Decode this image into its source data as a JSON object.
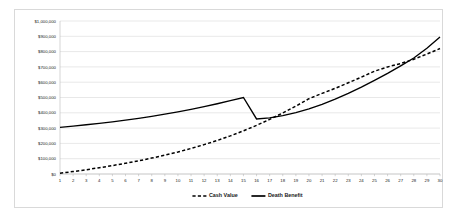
{
  "chart_data": {
    "type": "line",
    "title": "",
    "subtitle": "",
    "xlabel": "",
    "ylabel": "",
    "xlim": [
      1,
      30
    ],
    "ylim": [
      0,
      1000000
    ],
    "grid": true,
    "legend_position": "bottom",
    "x": [
      1,
      2,
      3,
      4,
      5,
      6,
      7,
      8,
      9,
      10,
      11,
      12,
      13,
      14,
      15,
      16,
      17,
      18,
      19,
      20,
      21,
      22,
      23,
      24,
      25,
      26,
      27,
      28,
      29,
      30
    ],
    "x_tick_labels": [
      "1",
      "2",
      "3",
      "4",
      "5",
      "6",
      "7",
      "8",
      "9",
      "10",
      "11",
      "12",
      "13",
      "14",
      "15",
      "16",
      "17",
      "18",
      "19",
      "20",
      "21",
      "22",
      "23",
      "24",
      "25",
      "26",
      "27",
      "28",
      "29",
      "30"
    ],
    "y_tick_values": [
      0,
      100000,
      200000,
      300000,
      400000,
      500000,
      600000,
      700000,
      800000,
      900000,
      1000000
    ],
    "y_tick_labels": [
      "$0",
      "$100,000",
      "$200,000",
      "$300,000",
      "$400,000",
      "$500,000",
      "$600,000",
      "$700,000",
      "$800,000",
      "$900,000",
      "$1,000,000"
    ],
    "series": [
      {
        "name": "Cash Value",
        "style": "dashed",
        "color": "#000000",
        "values": [
          5000,
          16000,
          28000,
          41000,
          55000,
          70000,
          86000,
          104000,
          123000,
          144000,
          167000,
          192000,
          219000,
          249000,
          282000,
          318000,
          357000,
          399000,
          444000,
          492000,
          527000,
          560000,
          596000,
          633000,
          672000,
          700000,
          722000,
          750000,
          784000,
          820000
        ]
      },
      {
        "name": "Death Benefit",
        "style": "solid",
        "color": "#000000",
        "values": [
          305000,
          313000,
          322000,
          331000,
          341000,
          352000,
          364000,
          377000,
          391000,
          406000,
          422000,
          440000,
          459000,
          479000,
          500000,
          360000,
          367000,
          381000,
          401000,
          425000,
          455000,
          489000,
          527000,
          568000,
          612000,
          658000,
          707000,
          758000,
          822000,
          895000
        ]
      }
    ]
  },
  "legend": {
    "items": [
      {
        "label": "Cash Value",
        "style": "dashed"
      },
      {
        "label": "Death Benefit",
        "style": "solid"
      }
    ]
  }
}
